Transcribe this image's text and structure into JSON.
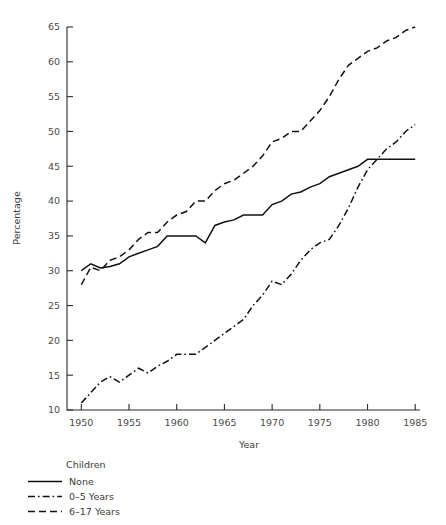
{
  "chart_data": {
    "type": "line",
    "title": "",
    "xlabel": "Year",
    "ylabel": "Percentage",
    "xlim": [
      1948.5,
      1985.5
    ],
    "ylim": [
      10,
      65
    ],
    "xticks": [
      1950,
      1955,
      1960,
      1965,
      1970,
      1975,
      1980,
      1985
    ],
    "xtick_labels": [
      "1950",
      "1955",
      "1960",
      "1965",
      "1970",
      "1975",
      "1980",
      "1985"
    ],
    "yticks": [
      10,
      15,
      20,
      25,
      30,
      35,
      40,
      45,
      50,
      55,
      60,
      65
    ],
    "ytick_labels": [
      "10",
      "15",
      "20",
      "25",
      "30",
      "35",
      "40",
      "45",
      "50",
      "55",
      "60",
      "65"
    ],
    "grid": false,
    "legend_position": "below-left",
    "legend_title": "Children",
    "x": [
      1950,
      1951,
      1952,
      1953,
      1954,
      1955,
      1956,
      1957,
      1958,
      1959,
      1960,
      1961,
      1962,
      1963,
      1964,
      1965,
      1966,
      1967,
      1968,
      1969,
      1970,
      1971,
      1972,
      1973,
      1974,
      1975,
      1976,
      1977,
      1978,
      1979,
      1980,
      1981,
      1982,
      1983,
      1984,
      1985
    ],
    "series": [
      {
        "name": "None",
        "dash": "solid",
        "values": [
          30.0,
          31.0,
          30.4,
          30.6,
          31.0,
          32.0,
          32.5,
          33.0,
          33.5,
          35.0,
          35.0,
          35.0,
          35.0,
          34.0,
          36.5,
          37.0,
          37.3,
          38.0,
          38.0,
          38.0,
          39.5,
          40.0,
          41.0,
          41.3,
          42.0,
          42.5,
          43.5,
          44.0,
          44.5,
          45.0,
          46.0,
          46.0,
          46.0,
          46.0,
          46.0,
          46.0
        ]
      },
      {
        "name": "0–5 Years",
        "dash": "dashdot",
        "values": [
          11.0,
          12.5,
          14.0,
          14.8,
          14.0,
          15.0,
          16.0,
          15.3,
          16.3,
          17.0,
          18.0,
          18.0,
          18.0,
          19.0,
          20.0,
          21.0,
          22.0,
          23.0,
          25.0,
          26.5,
          28.5,
          28.0,
          29.5,
          31.5,
          33.0,
          34.0,
          34.5,
          36.5,
          39.0,
          42.0,
          44.5,
          46.0,
          47.5,
          48.5,
          50.0,
          51.0
        ]
      },
      {
        "name": "6–17 Years",
        "dash": "dashed",
        "values": [
          28.0,
          30.5,
          30.0,
          31.5,
          32.0,
          33.0,
          34.5,
          35.5,
          35.5,
          37.0,
          38.0,
          38.5,
          40.0,
          40.0,
          41.5,
          42.5,
          43.0,
          44.0,
          45.0,
          46.5,
          48.5,
          49.0,
          50.0,
          50.0,
          51.5,
          53.0,
          55.0,
          57.5,
          59.5,
          60.5,
          61.5,
          62.0,
          63.0,
          63.5,
          64.5,
          65.0
        ]
      }
    ]
  },
  "legend": {
    "title": "Children",
    "items": [
      {
        "label": "None",
        "style": "solid"
      },
      {
        "label": "0–5 Years",
        "style": "dashdot"
      },
      {
        "label": "6–17 Years",
        "style": "dashed"
      }
    ]
  },
  "colors": {
    "line": "#111111",
    "axis": "#2b2b2b",
    "text": "#3a3a3a",
    "background": "#ffffff"
  }
}
